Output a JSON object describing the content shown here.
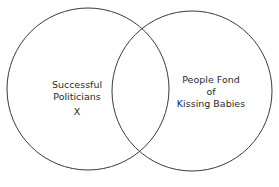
{
  "diagram": {
    "type": "venn",
    "stroke_color": "#3a3a3a",
    "background": "#ffffff",
    "sets": [
      {
        "id": "left",
        "lines": [
          "Successful",
          "Politicians"
        ],
        "marker": "X",
        "cx": 88,
        "cy": 89,
        "r": 81
      },
      {
        "id": "right",
        "lines": [
          "People Fond",
          "of",
          "Kissing Babies"
        ],
        "cx": 192,
        "cy": 91,
        "r": 80
      }
    ]
  }
}
